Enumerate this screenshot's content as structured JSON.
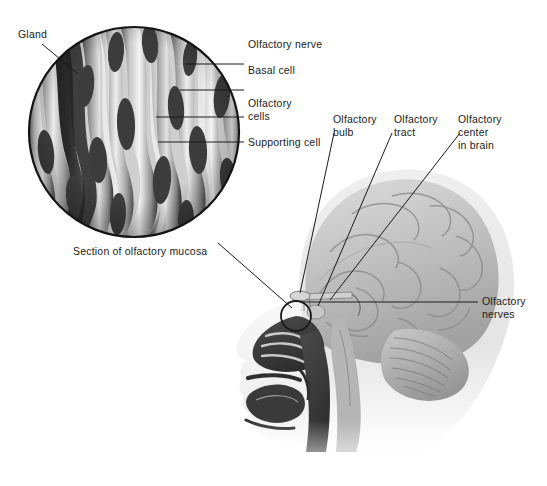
{
  "figure": {
    "background_color": "#ffffff",
    "text_color": "#1b1b1b",
    "leader_line_color": "#1a1a1a",
    "inset": {
      "name": "section-of-olfactory-mucosa",
      "caption": "Section of olfactory mucosa",
      "shape": "circle",
      "center_x": 134,
      "center_y": 132,
      "radius": 106,
      "border_color": "#141414"
    },
    "callout": {
      "small_circle_center_x": 296,
      "small_circle_center_y": 316,
      "small_circle_radius": 15
    }
  },
  "labels": {
    "gland": "Gland",
    "olfactory_nerve": "Olfactory nerve",
    "basal_cell": "Basal cell",
    "olfactory_cells_line1": "Olfactory",
    "olfactory_cells_line2": "cells",
    "supporting_cell": "Supporting cell",
    "caption": "Section of olfactory mucosa",
    "olfactory_bulb_line1": "Olfactory",
    "olfactory_bulb_line2": "bulb",
    "olfactory_tract_line1": "Olfactory",
    "olfactory_tract_line2": "tract",
    "olfactory_center_line1": "Olfactory",
    "olfactory_center_line2": "center",
    "olfactory_center_line3": "in brain",
    "olfactory_nerves_line1": "Olfactory",
    "olfactory_nerves_line2": "nerves"
  },
  "anatomy_parts": [
    "cerebrum",
    "cerebellum",
    "brainstem",
    "nasal cavity",
    "nasal turbinates",
    "hard palate",
    "tongue",
    "oral cavity",
    "pharynx",
    "olfactory bulb",
    "olfactory tract",
    "facial profile"
  ],
  "palette": {
    "tissue_light": "#e9e9e9",
    "tissue_mid": "#b9b9b9",
    "tissue_dark": "#6f6f6f",
    "tissue_darkest": "#2e2e2e",
    "brain_light": "#d7d7d7",
    "brain_mid": "#b0b0b0",
    "brain_shadow": "#8d8d8d",
    "skin_light": "#f3f3f3",
    "cavity_dark": "#3a3a3a"
  }
}
